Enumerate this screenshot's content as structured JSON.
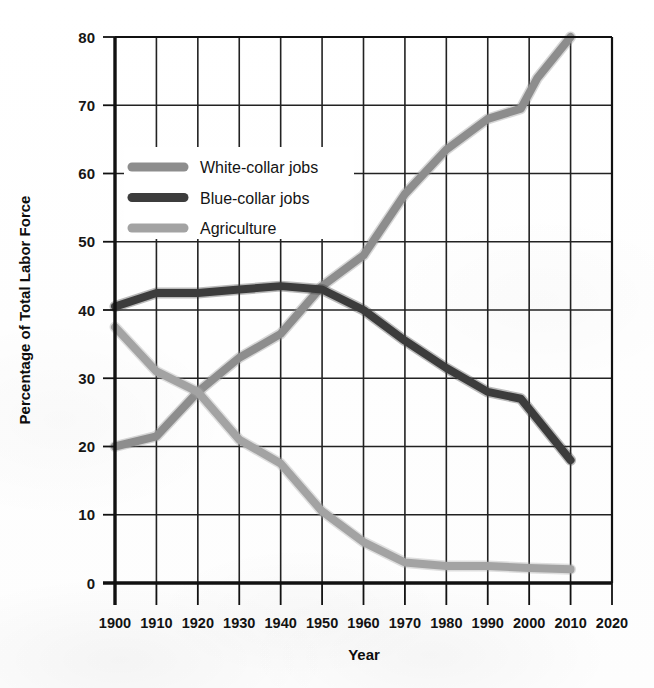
{
  "chart_data": {
    "type": "line",
    "title": "",
    "xlabel": "Year",
    "ylabel": "Percentage of Total Labor Force",
    "xlim": [
      1900,
      2020
    ],
    "ylim": [
      0,
      80
    ],
    "xticks": [
      1900,
      1910,
      1920,
      1930,
      1940,
      1950,
      1960,
      1970,
      1980,
      1990,
      2000,
      2010,
      2020
    ],
    "yticks": [
      0,
      10,
      20,
      30,
      40,
      50,
      60,
      70,
      80
    ],
    "grid": true,
    "legend_position": "upper-left-inside",
    "series": [
      {
        "name": "White-collar jobs",
        "color": "#8d8d8d",
        "x": [
          1900,
          1910,
          1920,
          1930,
          1940,
          1950,
          1960,
          1970,
          1980,
          1990,
          1998,
          2002,
          2010
        ],
        "values": [
          20.0,
          21.5,
          28.0,
          33.0,
          36.5,
          43.5,
          48.0,
          57.0,
          63.5,
          68.0,
          69.5,
          74.0,
          80.0
        ]
      },
      {
        "name": "Blue-collar jobs",
        "color": "#3c3c3c",
        "x": [
          1900,
          1910,
          1920,
          1930,
          1940,
          1950,
          1960,
          1970,
          1980,
          1990,
          1998,
          2002,
          2010
        ],
        "values": [
          40.5,
          42.5,
          42.5,
          43.0,
          43.5,
          43.0,
          40.0,
          35.5,
          31.5,
          28.0,
          27.0,
          24.0,
          18.0
        ]
      },
      {
        "name": "Agriculture",
        "color": "#a3a3a3",
        "x": [
          1900,
          1910,
          1920,
          1930,
          1940,
          1950,
          1960,
          1970,
          1980,
          1990,
          2000,
          2010
        ],
        "values": [
          37.5,
          31.0,
          28.0,
          21.0,
          17.5,
          10.5,
          6.0,
          3.0,
          2.5,
          2.5,
          2.2,
          2.0
        ]
      }
    ]
  },
  "axes": {
    "y_title": "Percentage of Total Labor Force",
    "x_title": "Year",
    "y_tick_labels": [
      "80",
      "70",
      "60",
      "50",
      "40",
      "30",
      "20",
      "10",
      "0"
    ],
    "x_tick_labels": [
      "1900",
      "1910",
      "1920",
      "1930",
      "1940",
      "1950",
      "1960",
      "1970",
      "1980",
      "1990",
      "2000",
      "2010",
      "2020"
    ]
  },
  "legend": {
    "items": [
      {
        "label": "White-collar jobs",
        "color": "#8d8d8d"
      },
      {
        "label": "Blue-collar jobs",
        "color": "#3c3c3c"
      },
      {
        "label": "Agriculture",
        "color": "#a3a3a3"
      }
    ]
  },
  "colors": {
    "white_collar": "#8d8d8d",
    "blue_collar": "#3c3c3c",
    "agriculture": "#a3a3a3",
    "axis": "#111111",
    "grid": "#222222",
    "background": "#ffffff"
  }
}
